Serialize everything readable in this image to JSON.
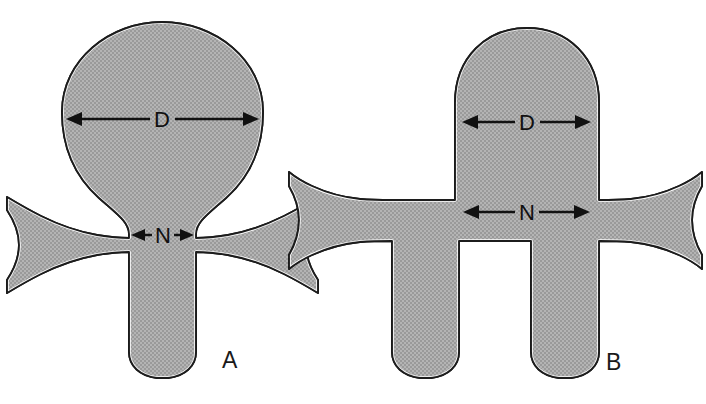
{
  "figure": {
    "background_color": "#ffffff",
    "fill_color": "#a8a8a8",
    "outline_color": "#1c1c1c",
    "gap_color": "#ffffff",
    "arrow_color": "#111111",
    "width": 706,
    "height": 404
  },
  "panels": [
    {
      "id": "A",
      "letter": "A",
      "letter_x": 222,
      "letter_y": 368,
      "dimensions": [
        {
          "label": "D",
          "name": "head-diameter",
          "x1": 66,
          "x2": 259,
          "y": 119,
          "label_x": 162,
          "label_y": 127
        },
        {
          "label": "N",
          "name": "neck-width",
          "x1": 131,
          "x2": 194,
          "y": 235,
          "label_x": 162,
          "label_y": 243
        }
      ]
    },
    {
      "id": "B",
      "letter": "B",
      "letter_x": 606,
      "letter_y": 370,
      "dimensions": [
        {
          "label": "D",
          "name": "head-diameter",
          "x1": 462,
          "x2": 591,
          "y": 122,
          "label_x": 527,
          "label_y": 130
        },
        {
          "label": "N",
          "name": "neck-width",
          "x1": 463,
          "x2": 590,
          "y": 212,
          "label_x": 527,
          "label_y": 220
        }
      ]
    }
  ],
  "shapes": {
    "spine_a": "M 162 22 C 212 22 262 58 262 112 C 262 158 238 190 212 208 C 198 218 192 226 192 236 L 192 239 L 206 239 C 236 239 258 234 276 226 C 292 219 304 212 318 205 L 318 218 C 312 226 308 238 308 248 C 308 258 312 268 318 276 L 318 287 C 304 280 292 274 276 268 C 258 261 236 256 206 256 L 194 256 L 194 352 C 194 366 184 376 168 378 L 158 378 C 142 376 132 366 132 352 L 132 256 L 120 256 C 90 256 68 261 50 268 C 34 274 22 280 8 287 L 8 276 C 14 268 18 258 18 248 C 18 238 14 226 8 218 L 8 205 C 22 212 34 219 50 226 C 68 234 90 239 120 239 L 134 239 L 134 236 C 134 226 128 218 114 208 C 88 190 62 158 62 112 C 62 58 112 22 162 22 Z",
    "spine_b": "M 527 28 C 568 28 600 56 600 102 L 600 206 L 616 206 C 640 206 658 202 672 196 C 684 191 692 186 700 180 L 700 192 C 694 200 690 210 690 220 C 690 230 694 240 700 248 L 700 259 C 692 253 684 248 672 243 C 658 237 640 233 616 233 L 600 233 L 600 352 C 600 366 590 376 574 378 L 560 378 C 544 376 534 366 534 352 L 534 233 L 454 233 L 454 352 C 454 366 444 376 428 378 L 420 378 C 404 376 394 366 394 352 L 394 233 L 438 233 L 438 206 L 394 206 L 394 233 L 438 233 Z",
    "note": "paths are layout geometry drawn in template"
  }
}
